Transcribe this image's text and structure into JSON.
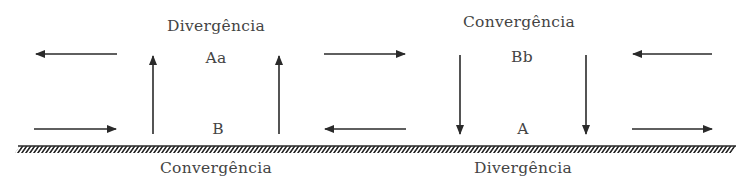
{
  "diagram": {
    "title": "",
    "colors": {
      "ink": "#2a2a2a",
      "text": "#444444",
      "background": "#ffffff"
    },
    "left_cell": {
      "top_label": "Divergência",
      "upper_center": "Aa",
      "lower_center": "B",
      "bottom_label": "Convergência",
      "vertical_flow": "up",
      "top_flow": "outward",
      "bottom_flow": "inward"
    },
    "right_cell": {
      "top_label": "Convergência",
      "upper_center": "Bb",
      "lower_center": "A",
      "bottom_label": "Divergência",
      "vertical_flow": "down",
      "top_flow": "inward",
      "bottom_flow": "outward"
    },
    "ground": {
      "type": "hatched-surface"
    }
  }
}
